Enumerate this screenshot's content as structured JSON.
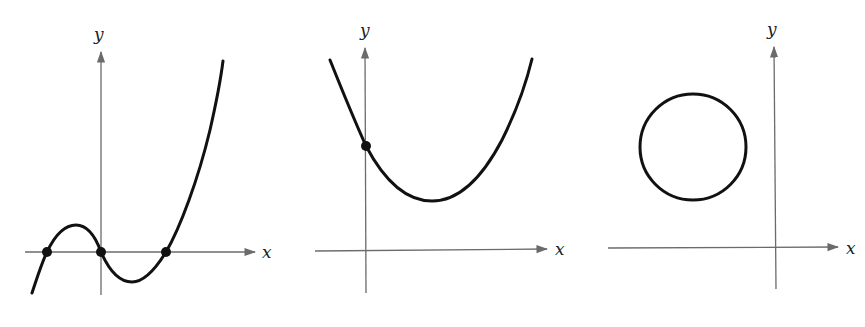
{
  "panels": [
    {
      "name": "cubic-graph",
      "x_label": "x",
      "y_label": "y",
      "description": "Cubic curve crossing x-axis at three marked points, one at the origin"
    },
    {
      "name": "parabola-graph",
      "x_label": "x",
      "y_label": "y",
      "description": "Upward parabola with marked y-intercept, vertex above x-axis"
    },
    {
      "name": "circle-graph",
      "x_label": "x",
      "y_label": "y",
      "description": "Circle in second quadrant, not touching axes"
    }
  ],
  "colors": {
    "axis": "#6b6b6b",
    "curve": "#111111",
    "background": "#ffffff"
  }
}
